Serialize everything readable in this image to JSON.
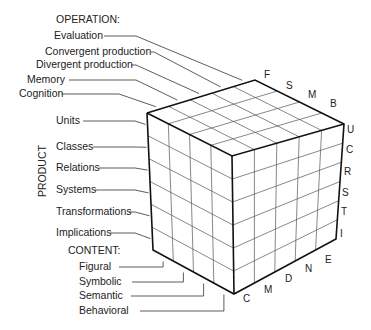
{
  "operation": {
    "header": "OPERATION:",
    "items": [
      "Evaluation",
      "Convergent production",
      "Divergent production",
      "Memory",
      "Cognition"
    ],
    "letters": [
      "F",
      "S",
      "M",
      "B"
    ]
  },
  "product": {
    "header": "PRODUCT",
    "items": [
      "Units",
      "Classes",
      "Relations",
      "Systems",
      "Transformations",
      "Implications"
    ],
    "letters": [
      "U",
      "C",
      "R",
      "S",
      "T",
      "I"
    ]
  },
  "content": {
    "header": "CONTENT:",
    "items": [
      "Figural",
      "Symbolic",
      "Semantic",
      "Behavioral"
    ],
    "letters": [
      "C",
      "M",
      "D",
      "N",
      "E"
    ]
  }
}
